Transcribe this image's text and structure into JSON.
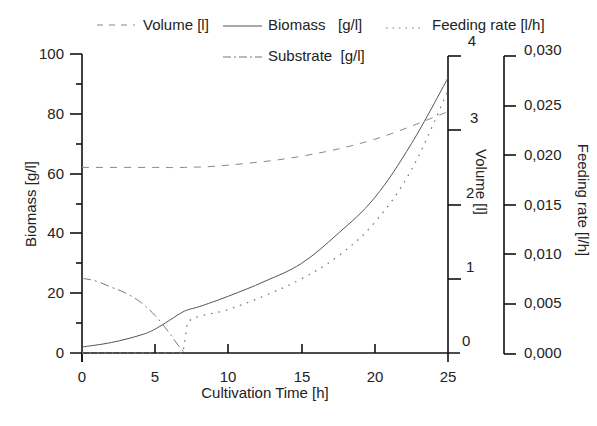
{
  "chart_data": {
    "type": "line",
    "title": "",
    "xlabel": "Cultivation Time [h]",
    "xlim": [
      0,
      25
    ],
    "x_ticks": [
      "0",
      "5",
      "10",
      "15",
      "20",
      "25"
    ],
    "axes": {
      "left": {
        "label": "Biomass [g/l]",
        "ylim": [
          0,
          100
        ],
        "ticks": [
          "0",
          "20",
          "40",
          "60",
          "80",
          "100"
        ]
      },
      "right_volume": {
        "label": "Volume [l]",
        "ylim": [
          0,
          4
        ],
        "ticks": [
          "0",
          "1",
          "2",
          "3",
          "4"
        ]
      },
      "right_feeding": {
        "label": "Feeding rate [l/h]",
        "ylim": [
          0,
          0.03
        ],
        "ticks": [
          "0,000",
          "0,005",
          "0,010",
          "0,015",
          "0,020",
          "0,025",
          "0,030"
        ]
      }
    },
    "grid": false,
    "legend_position": "top",
    "legend": [
      {
        "name": "Volume [l]",
        "style": "dashed"
      },
      {
        "name": "Biomass   [g/l]",
        "style": "solid"
      },
      {
        "name": "Feeding rate [l/h]",
        "style": "dotted"
      },
      {
        "name": "Substrate  [g/l]",
        "style": "dash-dot"
      }
    ],
    "series": [
      {
        "name": "Volume [l]",
        "axis": "right_volume",
        "style": "dashed",
        "x": [
          0,
          5,
          7,
          10,
          15,
          20,
          25
        ],
        "values": [
          2.5,
          2.5,
          2.5,
          2.53,
          2.65,
          2.88,
          3.25
        ]
      },
      {
        "name": "Biomass [g/l]",
        "axis": "left",
        "style": "solid",
        "x": [
          0,
          2,
          4,
          5,
          6,
          7,
          8,
          10,
          12.5,
          15,
          17.5,
          20,
          22.5,
          25
        ],
        "values": [
          2,
          3.5,
          6,
          8,
          11,
          14,
          15.5,
          19,
          24,
          30,
          40,
          52,
          70,
          92
        ]
      },
      {
        "name": "Feeding rate [l/h]",
        "axis": "right_feeding",
        "style": "dotted",
        "x": [
          0,
          6.9,
          7.2,
          10,
          12.5,
          15,
          17.5,
          20,
          22.5,
          25
        ],
        "values": [
          0,
          0,
          0.0031,
          0.0044,
          0.0058,
          0.0075,
          0.0098,
          0.0132,
          0.0185,
          0.0265
        ]
      },
      {
        "name": "Substrate [g/l]",
        "axis": "left",
        "style": "dash-dot",
        "x": [
          0,
          1,
          2,
          3,
          4,
          5,
          6,
          6.5,
          7
        ],
        "values": [
          25,
          24,
          22,
          20,
          17,
          12.5,
          6.5,
          3,
          0
        ]
      }
    ]
  }
}
